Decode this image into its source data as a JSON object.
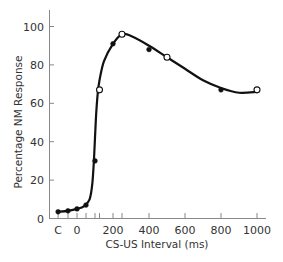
{
  "chart_data": {
    "type": "line",
    "title": "",
    "xlabel": "CS-US Interval (ms)",
    "ylabel": "Percentage NM Response",
    "ylim": [
      0,
      100
    ],
    "xlim": [
      -120,
      1000
    ],
    "grid": false,
    "legend": null,
    "x_tick_labels": [
      {
        "value": -105,
        "label": "C"
      },
      {
        "value": 0,
        "label": "0"
      },
      {
        "value": 200,
        "label": "200"
      },
      {
        "value": 400,
        "label": "400"
      },
      {
        "value": 600,
        "label": "600"
      },
      {
        "value": 800,
        "label": "800"
      },
      {
        "value": 1000,
        "label": "1000"
      }
    ],
    "x_minor_ticks": [
      -105,
      -50,
      0,
      50,
      100,
      125,
      200,
      250,
      400,
      600,
      800,
      1000
    ],
    "y_ticks": [
      0,
      20,
      40,
      60,
      80,
      100
    ],
    "series": [
      {
        "name": "filled points",
        "marker": "filled-circle",
        "points": [
          {
            "x": "C",
            "xpos": -105,
            "y": 3.5
          },
          {
            "x": -50,
            "xpos": -50,
            "y": 4
          },
          {
            "x": 0,
            "xpos": 0,
            "y": 5
          },
          {
            "x": 50,
            "xpos": 50,
            "y": 7
          },
          {
            "x": 100,
            "xpos": 100,
            "y": 30
          },
          {
            "x": 200,
            "xpos": 200,
            "y": 91
          },
          {
            "x": 400,
            "xpos": 400,
            "y": 88
          },
          {
            "x": 800,
            "xpos": 800,
            "y": 67
          }
        ]
      },
      {
        "name": "open points",
        "marker": "open-circle",
        "points": [
          {
            "x": 125,
            "xpos": 125,
            "y": 67
          },
          {
            "x": 250,
            "xpos": 250,
            "y": 96
          },
          {
            "x": 500,
            "xpos": 500,
            "y": 84
          },
          {
            "x": 1000,
            "xpos": 1000,
            "y": 67
          }
        ]
      }
    ],
    "fitted_curve": [
      [
        -105,
        3.5
      ],
      [
        -50,
        4
      ],
      [
        0,
        5
      ],
      [
        40,
        6.5
      ],
      [
        70,
        10
      ],
      [
        85,
        18
      ],
      [
        95,
        32
      ],
      [
        105,
        52
      ],
      [
        115,
        65
      ],
      [
        125,
        72
      ],
      [
        150,
        82
      ],
      [
        200,
        91
      ],
      [
        250,
        96
      ],
      [
        300,
        95
      ],
      [
        400,
        90
      ],
      [
        500,
        84
      ],
      [
        600,
        78
      ],
      [
        700,
        72
      ],
      [
        800,
        68
      ],
      [
        900,
        65.5
      ],
      [
        1000,
        66
      ]
    ]
  }
}
